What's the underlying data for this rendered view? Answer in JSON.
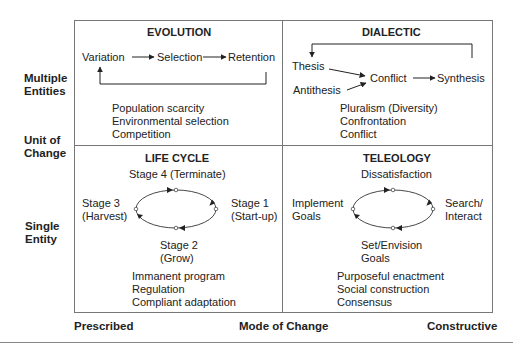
{
  "diagram": {
    "y_axis": {
      "top_label": [
        "Multiple",
        "Entities"
      ],
      "middle_label": [
        "Unit of",
        "Change"
      ],
      "bottom_label": [
        "Single",
        "Entity"
      ]
    },
    "x_axis": {
      "left_label": "Prescribed",
      "middle_label": "Mode of Change",
      "right_label": "Constructive"
    },
    "quadrants": {
      "evolution": {
        "title": "EVOLUTION",
        "flow": [
          "Variation",
          "Selection",
          "Retention"
        ],
        "notes": [
          "Population scarcity",
          "Environmental selection",
          "Competition"
        ]
      },
      "dialectic": {
        "title": "DIALECTIC",
        "flow": {
          "thesis": "Thesis",
          "antithesis": "Antithesis",
          "conflict": "Conflict",
          "synthesis": "Synthesis"
        },
        "notes": [
          "Pluralism (Diversity)",
          "Confrontation",
          "Conflict"
        ]
      },
      "life_cycle": {
        "title": "LIFE CYCLE",
        "stages": {
          "top": "Stage 4 (Terminate)",
          "right": [
            "Stage 1",
            "(Start-up)"
          ],
          "bottom": [
            "Stage 2",
            "(Grow)"
          ],
          "left": [
            "Stage 3",
            "(Harvest)"
          ]
        },
        "notes": [
          "Immanent program",
          "Regulation",
          "Compliant adaptation"
        ]
      },
      "teleology": {
        "title": "TELEOLOGY",
        "stages": {
          "top": "Dissatisfaction",
          "right": [
            "Search/",
            "Interact"
          ],
          "bottom": [
            "Set/Envision",
            "Goals"
          ],
          "left": [
            "Implement",
            "Goals"
          ]
        },
        "notes": [
          "Purposeful enactment",
          "Social construction",
          "Consensus"
        ]
      }
    }
  }
}
